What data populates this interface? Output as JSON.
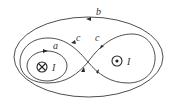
{
  "diagram": {
    "curves": [
      {
        "id": "b",
        "label": "b",
        "shape": "outer ellipse enclosing both wires",
        "arrow_direction": "left (counter-clockwise)"
      },
      {
        "id": "a",
        "label": "a",
        "shape": "small ellipse around left wire",
        "arrow_direction": "right (clockwise)"
      },
      {
        "id": "c",
        "label": "c",
        "shape": "figure-eight around both wires",
        "labels_count": 2
      }
    ],
    "wires": [
      {
        "id": "left",
        "symbol": "⊗",
        "meaning": "current into page",
        "label": "I"
      },
      {
        "id": "right",
        "symbol": "⊙",
        "meaning": "current out of page",
        "label": "I"
      }
    ],
    "labels": {
      "b": "b",
      "a": "a",
      "c1": "c",
      "c2": "c",
      "I_left": "I",
      "I_right": "I"
    },
    "colors": {
      "line": "#3a3a3a",
      "background": "#ffffff"
    }
  }
}
